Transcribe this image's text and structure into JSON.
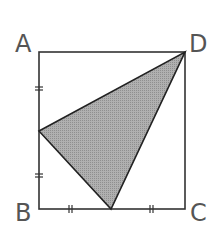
{
  "diagram": {
    "type": "geometry-square-with-shaded-triangle",
    "labels": {
      "A": "A",
      "B": "B",
      "C": "C",
      "D": "D"
    },
    "points": {
      "A": [
        39,
        52
      ],
      "D": [
        185,
        52
      ],
      "B": [
        39,
        209
      ],
      "C": [
        185,
        209
      ],
      "M_AB": [
        39,
        131
      ],
      "M_BC": [
        111,
        209
      ]
    },
    "shaded_triangle": [
      "M_AB",
      "M_BC",
      "D"
    ],
    "equal_segment_marks": {
      "AB_halves": "double-tick",
      "BC_halves": "double-tick"
    },
    "colors": {
      "stroke": "#333333",
      "fill": "#a6a6a6",
      "label": "#555555"
    }
  }
}
